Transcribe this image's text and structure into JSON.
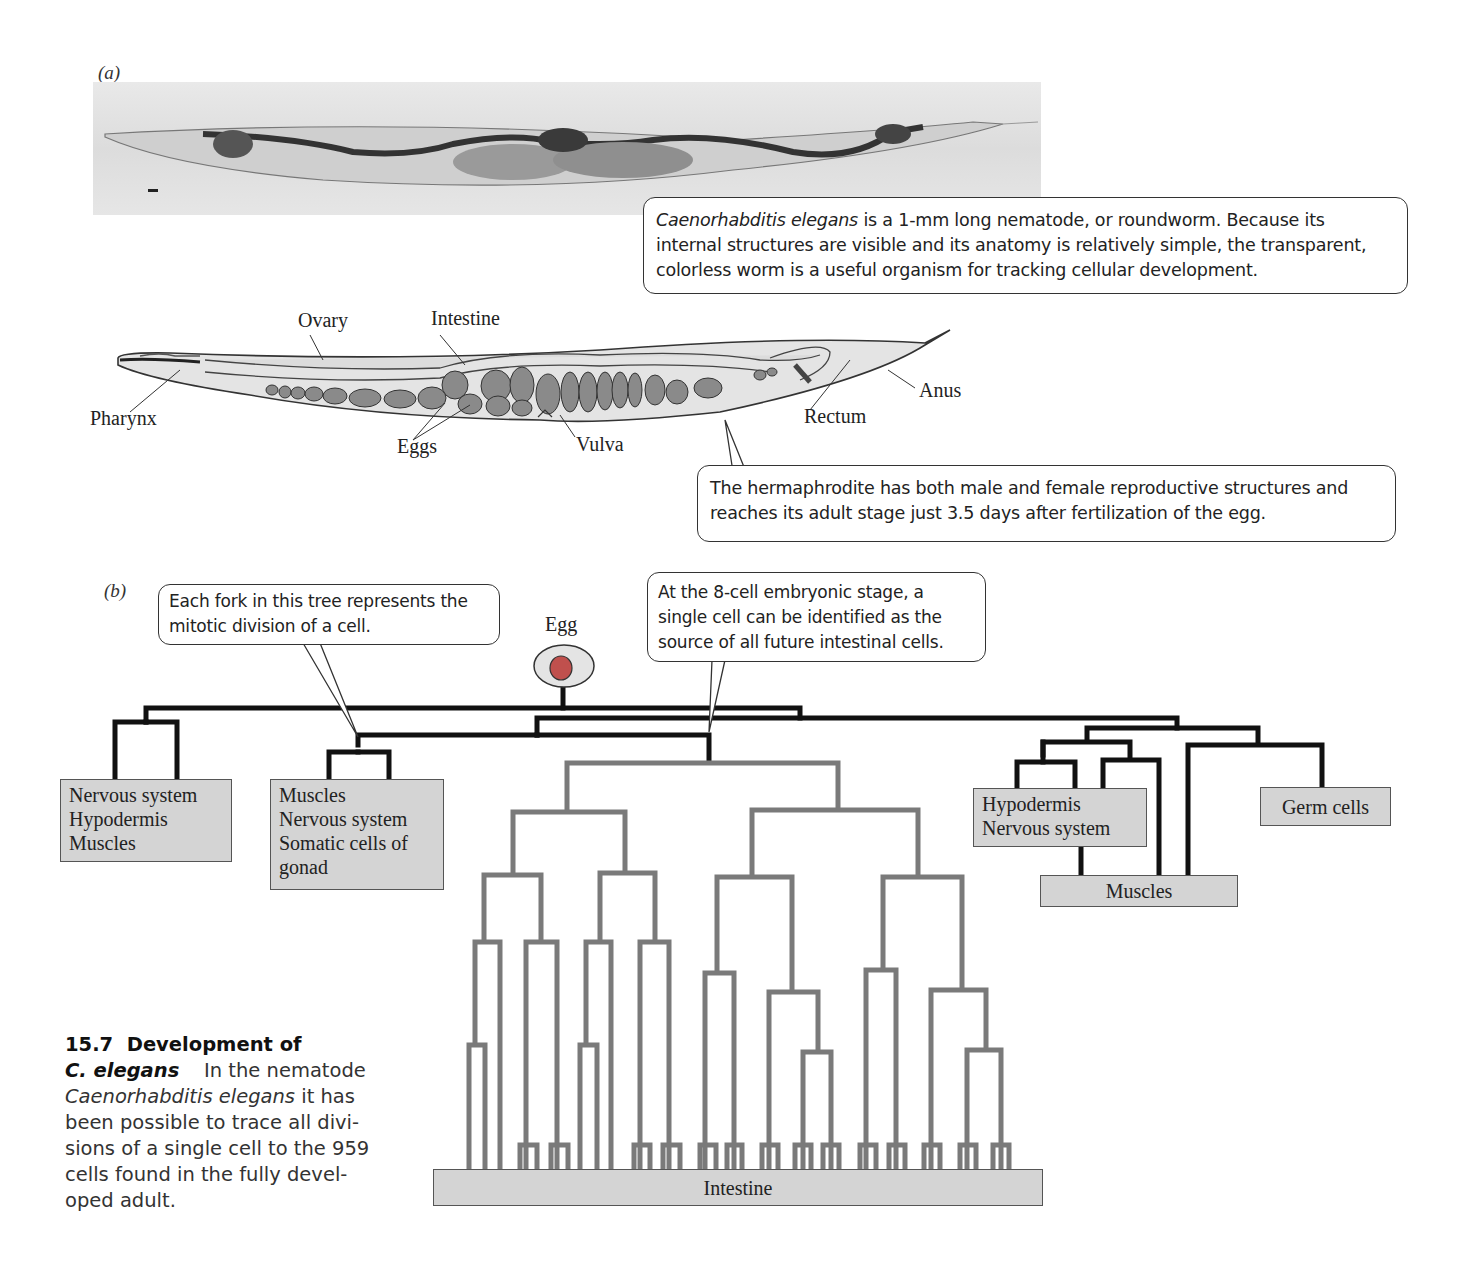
{
  "panel_a": {
    "label": "(a)",
    "micrograph_alt": "light micrograph of C. elegans",
    "callout_1": {
      "italic": "Caenorhabditis elegans",
      "text": " is a 1-mm long nematode, or roundworm. Because its internal structures are visible and its anatomy is relatively simple, the transparent, colorless worm is a useful organism for tracking cellular development."
    },
    "anatomy_labels": {
      "ovary": "Ovary",
      "intestine": "Intestine",
      "pharynx": "Pharynx",
      "eggs": "Eggs",
      "vulva": "Vulva",
      "rectum": "Rectum",
      "anus": "Anus"
    },
    "callout_2": "The hermaphrodite has both male and female reproductive structures and reaches its adult stage just 3.5 days after fertilization of the egg."
  },
  "panel_b": {
    "label": "(b)",
    "egg_label": "Egg",
    "callout_fork": "Each fork in this tree represents the mitotic division of a cell.",
    "callout_8cell": "At the 8-cell embryonic stage, a single cell can be identified as the source of all future intestinal cells.",
    "boxes": {
      "box1": [
        "Nervous system",
        "Hypodermis",
        "Muscles"
      ],
      "box2": [
        "Muscles",
        "Nervous system",
        "Somatic cells of",
        "gonad"
      ],
      "box3": [
        "Hypodermis",
        "Nervous system"
      ],
      "box4": [
        "Germ cells"
      ],
      "box5": [
        "Muscles"
      ],
      "intestine": [
        "Intestine"
      ]
    },
    "colors": {
      "lineage_black": "#111111",
      "intestine_gray": "#7a7a7a",
      "box_fill": "#d4d4d4",
      "egg_nucleus": "#c0504d",
      "egg_fill": "#e4e4e4"
    }
  },
  "caption": {
    "number": "15.7",
    "title_1": "Development of",
    "title_2": "C. elegans",
    "text_1": "In the nematode",
    "italic": "Caenorhabditis elegans",
    "text_2": " it has been possible to trace all divisions of a single cell to the 959 cells found in the fully developed adult.",
    "line3": "been possible to trace all divi-",
    "line4": "sions of a single cell to the 959",
    "line5": "cells found in the fully devel-",
    "line6": "oped adult."
  }
}
